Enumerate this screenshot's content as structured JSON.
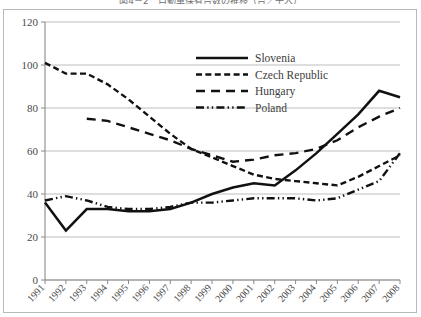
{
  "chart_data": {
    "type": "line",
    "title": "図4－2　自動車保有台数の推移（台／千人）",
    "xlabel": "",
    "ylabel": "",
    "xlim": [
      1991,
      2008
    ],
    "ylim": [
      0,
      120
    ],
    "yticks": [
      0,
      20,
      40,
      60,
      80,
      100,
      120
    ],
    "grid": true,
    "legend_position": "top-center",
    "categories": [
      "1991",
      "1992",
      "1993",
      "1994",
      "1995",
      "1996",
      "1997",
      "1998",
      "1999",
      "2000",
      "2001",
      "2002",
      "2003",
      "2004",
      "2005",
      "2006",
      "2007",
      "2008"
    ],
    "series": [
      {
        "name": "Slovenia",
        "style": "solid",
        "values": [
          36,
          23,
          33,
          33,
          32,
          32,
          33,
          36,
          40,
          43,
          45,
          44,
          51,
          59,
          68,
          77,
          88,
          85
        ]
      },
      {
        "name": "Czech Republic",
        "style": "dashed-short",
        "values": [
          101,
          96,
          96,
          91,
          84,
          76,
          68,
          61,
          57,
          53,
          49,
          47,
          46,
          45,
          44,
          48,
          53,
          58
        ]
      },
      {
        "name": "Hungary",
        "style": "dashed-long",
        "values": [
          null,
          null,
          75,
          74,
          71,
          68,
          65,
          61,
          58,
          55,
          56,
          58,
          59,
          61,
          65,
          71,
          76,
          80
        ]
      },
      {
        "name": "Poland",
        "style": "dash-dot-dot",
        "values": [
          37,
          39,
          37,
          34,
          33,
          33,
          34,
          36,
          36,
          37,
          38,
          38,
          38,
          37,
          38,
          42,
          46,
          59
        ]
      }
    ]
  },
  "legend": {
    "items": [
      {
        "label": "Slovenia"
      },
      {
        "label": "Czech Republic"
      },
      {
        "label": "Hungary"
      },
      {
        "label": "Poland"
      }
    ]
  },
  "axes": {
    "y_tick_labels": [
      "0",
      "20",
      "40",
      "60",
      "80",
      "100",
      "120"
    ],
    "x_tick_labels": [
      "1991",
      "1992",
      "1993",
      "1994",
      "1995",
      "1996",
      "1997",
      "1998",
      "1999",
      "2000",
      "2001",
      "2002",
      "2003",
      "2004",
      "2005",
      "2006",
      "2007",
      "2008"
    ]
  }
}
